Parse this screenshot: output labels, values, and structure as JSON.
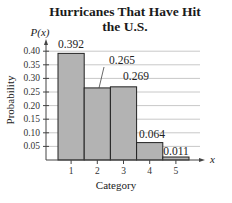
{
  "chart_data": {
    "type": "bar",
    "title": "Hurricanes That Have Hit the U.S.",
    "title_lines": [
      "Hurricanes That Have Hit",
      "the U.S."
    ],
    "xlabel": "Category",
    "ylabel": "Probability",
    "y_axis_symbol": "P(x)",
    "x_axis_symbol": "x",
    "categories": [
      "1",
      "2",
      "3",
      "4",
      "5"
    ],
    "values": [
      0.392,
      0.265,
      0.269,
      0.064,
      0.011
    ],
    "value_labels": [
      "0.392",
      "0.265",
      "0.269",
      "0.064",
      "0.011"
    ],
    "yticks": [
      "0.05",
      "0.10",
      "0.15",
      "0.20",
      "0.25",
      "0.30",
      "0.35",
      "0.40"
    ],
    "ylim": [
      0,
      0.42
    ],
    "grid": true,
    "bar_color": "#b3b3b3",
    "bar_edge_color": "#222222",
    "grid_color": "#c8c8c8"
  }
}
